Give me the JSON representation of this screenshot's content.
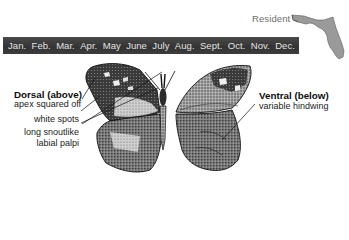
{
  "range": {
    "status_label": "Resident",
    "map_region": "florida-map",
    "map_color": "#9a9a9a"
  },
  "flight_period": {
    "bar_color": "#3a3a3a",
    "text_color": "#e4e4e4",
    "months": [
      "Jan.",
      "Feb.",
      "Mar.",
      "Apr.",
      "May",
      "June",
      "July",
      "Aug.",
      "Sept.",
      "Oct.",
      "Nov.",
      "Dec."
    ]
  },
  "annotations": {
    "dorsal": {
      "title": "Dorsal (above)",
      "notes": [
        "apex squared off",
        "white spots",
        "long snoutlike",
        "labial palpi"
      ]
    },
    "ventral": {
      "title": "Ventral (below)",
      "notes": [
        "variable hindwing"
      ]
    }
  }
}
